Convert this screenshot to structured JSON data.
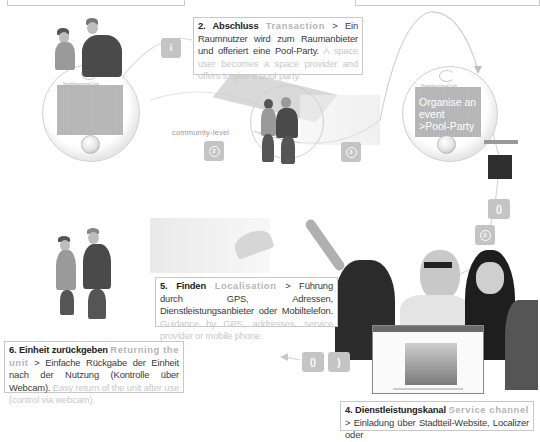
{
  "device_screens": {
    "small_label": "Neighbourhood-Link",
    "screen_3_text": [
      "Organise an",
      "event",
      ">Pool-Party"
    ]
  },
  "labels": {
    "community_level": "community-level"
  },
  "step_buttons": [
    {
      "id": "b1",
      "glyph": "i"
    },
    {
      "id": "b2",
      "glyph": "2"
    },
    {
      "id": "b3",
      "glyph": "3"
    },
    {
      "id": "b4",
      "glyph": "()"
    },
    {
      "id": "b5",
      "glyph": "3"
    },
    {
      "id": "b6",
      "glyph": "()"
    },
    {
      "id": "b7",
      "glyph": ")"
    }
  ],
  "captions": {
    "step2": {
      "heading": "2. Abschluss",
      "heading_en": "Transaction",
      "text_de": "> Ein Raumnutzer wird zum Raumanbieter und offeriert eine Pool-Party.",
      "text_en": "A space user becomes a space provider and offers to give a pool party."
    },
    "step4": {
      "heading": "4. Dienstleistungskanal",
      "heading_en": "Service channel",
      "text_de": "> Einladung über Stadtteil-Website, Localizer oder"
    },
    "step5": {
      "heading": "5. Finden",
      "heading_en": "Localisation",
      "text_de": "> Führung durch GPS, Adressen, Dienstleistungsanbieter oder Mobiltelefon.",
      "text_en": "Guidance by GPS, addresses, service provider or mobile phone."
    },
    "step6": {
      "heading": "6. Einheit zurückgeben",
      "heading_en": "Returning the unit",
      "text_de": "> Einfache Rückgabe der Einheit nach der Nutzung (Kontrolle über Webcam).",
      "text_en": "Easy return of the unit after use (control via webcam)."
    }
  },
  "colors": {
    "background": "#ffffff",
    "button_grey": "#c4c4c4",
    "screen_grey": "#b5b5b5",
    "border": "#c8c8c8",
    "text_dark": "#3a3a3a",
    "text_light": "#c8c8c8"
  }
}
